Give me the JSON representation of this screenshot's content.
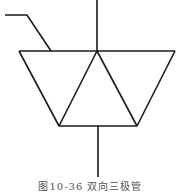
{
  "diagram": {
    "type": "circuit-symbol",
    "name": "TRIAC (bidirectional thyristor)",
    "stroke_color": "#1a1a1a",
    "caption": "图10-36  双向三极管"
  }
}
